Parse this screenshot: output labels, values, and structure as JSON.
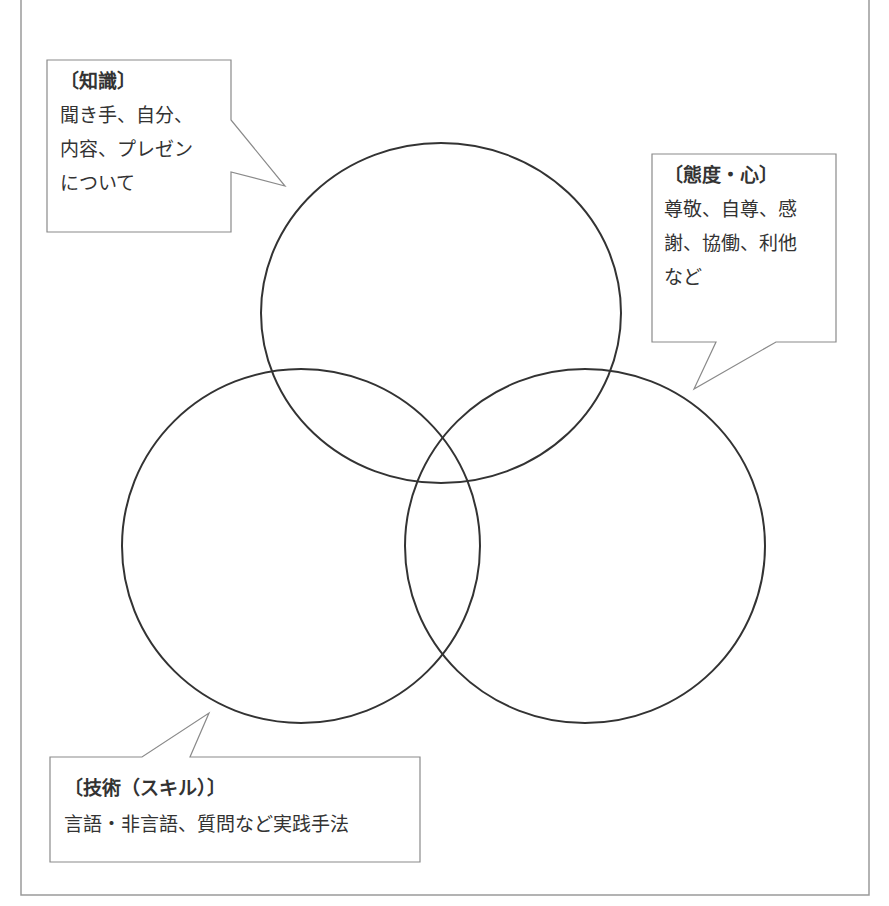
{
  "diagram": {
    "title_partial": "",
    "frame": {
      "stroke": "#9a9a9a"
    },
    "circles": [
      {
        "id": "knowledge-circle",
        "cx": 441,
        "cy": 313,
        "rx": 180,
        "ry": 170,
        "stroke": "#333333"
      },
      {
        "id": "skill-circle",
        "cx": 301,
        "cy": 546,
        "rx": 179,
        "ry": 177,
        "stroke": "#333333"
      },
      {
        "id": "attitude-circle",
        "cx": 585,
        "cy": 546,
        "rx": 180,
        "ry": 177,
        "stroke": "#333333"
      }
    ],
    "callouts": {
      "knowledge": {
        "heading": "〔知識〕",
        "lines": [
          "聞き手、自分、",
          "内容、プレゼン",
          "について"
        ]
      },
      "attitude": {
        "heading": "〔態度・心〕",
        "lines": [
          "尊敬、自尊、感",
          "謝、協働、利他",
          "など"
        ]
      },
      "skill": {
        "heading": "〔技術（スキル）〕",
        "lines": [
          "言語・非言語、質問など実践手法"
        ]
      }
    }
  }
}
